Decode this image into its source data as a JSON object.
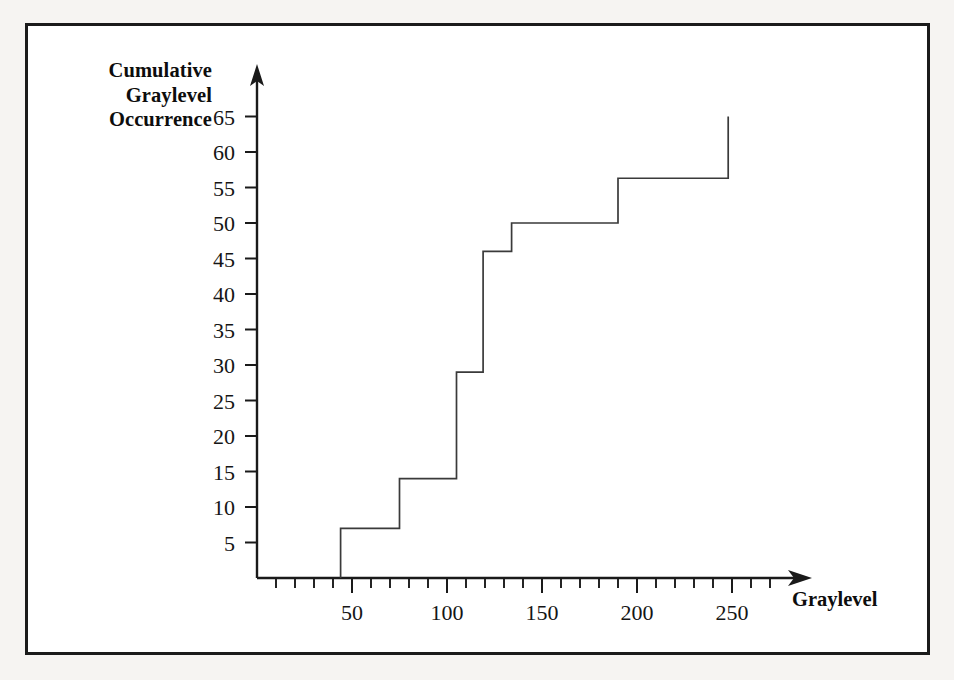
{
  "chart_data": {
    "type": "line",
    "subtype": "step",
    "title": "",
    "xlabel": "Graylevel",
    "ylabel": "Cumulative Graylevel Occurrence",
    "ylabel_lines": [
      "Cumulative",
      "Graylevel",
      "Occurrence"
    ],
    "xlim": [
      0,
      285
    ],
    "ylim": [
      0,
      67
    ],
    "grid": false,
    "legend": null,
    "x_major_ticks": [
      50,
      100,
      150,
      200,
      250
    ],
    "x_major_tick_labels": [
      "50",
      "100",
      "150",
      "200",
      "250"
    ],
    "x_minor_tick_interval": 10,
    "x_minor_ticks": [
      10,
      20,
      30,
      40,
      50,
      60,
      70,
      80,
      90,
      100,
      110,
      120,
      130,
      140,
      150,
      160,
      170,
      180,
      190,
      200,
      210,
      220,
      230,
      240,
      250,
      260,
      270
    ],
    "y_major_ticks": [
      5,
      10,
      15,
      20,
      25,
      30,
      35,
      40,
      45,
      50,
      55,
      60,
      65
    ],
    "y_major_tick_labels": [
      "5",
      "10",
      "15",
      "20",
      "25",
      "30",
      "35",
      "40",
      "45",
      "50",
      "55",
      "60",
      "65"
    ],
    "x_axis_arrow": true,
    "y_axis_arrow": true,
    "series": [
      {
        "name": "Cumulative Graylevel Occurrence",
        "color": "#3a3a3a",
        "step_points": [
          {
            "x": 44,
            "y": 0
          },
          {
            "x": 44,
            "y": 7
          },
          {
            "x": 75,
            "y": 7
          },
          {
            "x": 75,
            "y": 14
          },
          {
            "x": 105,
            "y": 14
          },
          {
            "x": 105,
            "y": 29
          },
          {
            "x": 119,
            "y": 29
          },
          {
            "x": 119,
            "y": 46
          },
          {
            "x": 134,
            "y": 46
          },
          {
            "x": 134,
            "y": 50
          },
          {
            "x": 190,
            "y": 50
          },
          {
            "x": 190,
            "y": 56.3
          },
          {
            "x": 248,
            "y": 56.3
          },
          {
            "x": 248,
            "y": 65
          }
        ],
        "step_values": [
          {
            "graylevel": 44,
            "cumulative": 7
          },
          {
            "graylevel": 75,
            "cumulative": 14
          },
          {
            "graylevel": 105,
            "cumulative": 29
          },
          {
            "graylevel": 119,
            "cumulative": 46
          },
          {
            "graylevel": 134,
            "cumulative": 50
          },
          {
            "graylevel": 190,
            "cumulative": 56
          },
          {
            "graylevel": 248,
            "cumulative": 65
          }
        ]
      }
    ],
    "colors": {
      "axis": "#1a1a1a",
      "curve": "#3a3a3a",
      "frame": "#1b1b1b",
      "background": "#ffffff",
      "page": "#f6f4f2"
    }
  }
}
